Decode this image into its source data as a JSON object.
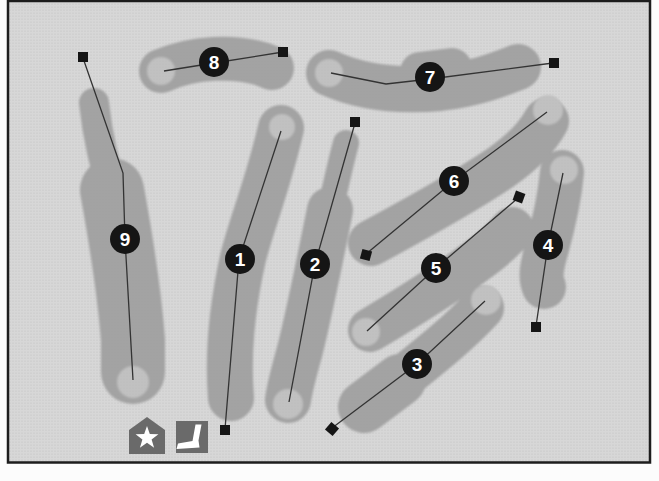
{
  "figure": {
    "colors": {
      "page": "#fcfcfc",
      "map_background": "#d7d7d7",
      "fairway": "#a3a3a3",
      "green": "#c1c1c1",
      "marker": "#151515",
      "line": "#333333",
      "number_text": "#ffffff",
      "icon_background": "#6a6a6a",
      "icon_foreground": "#ffffff",
      "border": "#1d1d1d"
    }
  },
  "holes": [
    {
      "number": "1",
      "badge": [
        240,
        259
      ],
      "green": [
        282,
        127,
        13
      ],
      "tee": [
        225,
        430,
        0
      ],
      "line": [
        [
          225,
          429
        ],
        [
          239,
          259
        ],
        [
          281,
          131
        ]
      ],
      "fairway": [
        {
          "d": "M 281,128 C 268,185 251,225 243,258 C 233,303 227,350 231,398",
          "w": 46
        }
      ]
    },
    {
      "number": "2",
      "badge": [
        315,
        264
      ],
      "green": [
        288,
        404,
        15
      ],
      "tee": [
        355,
        122,
        0
      ],
      "line": [
        [
          355,
          123
        ],
        [
          315,
          264
        ],
        [
          289,
          402
        ]
      ],
      "fairway": [
        {
          "d": "M 346,143 C 340,165 336,185 330,210",
          "w": 26
        },
        {
          "d": "M 330,210 C 320,260 310,310 300,350 C 293,375 289,392 288,400",
          "w": 46
        }
      ]
    },
    {
      "number": "3",
      "badge": [
        417,
        364
      ],
      "green": [
        486,
        300,
        15
      ],
      "tee": [
        332,
        429,
        40
      ],
      "line": [
        [
          332,
          428
        ],
        [
          417,
          364
        ],
        [
          485,
          301
        ]
      ],
      "fairway": [
        {
          "d": "M 364,407 L 400,380",
          "w": 52
        },
        {
          "d": "M 400,380 C 435,352 462,330 482,308",
          "w": 44
        }
      ]
    },
    {
      "number": "4",
      "badge": [
        548,
        245
      ],
      "green": [
        564,
        170,
        14
      ],
      "tee": [
        536,
        327,
        0
      ],
      "line": [
        [
          536,
          326
        ],
        [
          548,
          245
        ],
        [
          563,
          173
        ]
      ],
      "fairway": [
        {
          "d": "M 562,172 C 559,205 552,230 547,248 C 541,268 540,278 544,287",
          "w": 44
        }
      ]
    },
    {
      "number": "5",
      "badge": [
        436,
        268
      ],
      "green": [
        366,
        332,
        14
      ],
      "tee": [
        519,
        197,
        20
      ],
      "line": [
        [
          518,
          198
        ],
        [
          436,
          268
        ],
        [
          367,
          331
        ]
      ],
      "fairway": [
        {
          "d": "M 370,330 C 400,312 440,288 475,262 C 492,250 505,238 512,229",
          "w": 44
        }
      ]
    },
    {
      "number": "6",
      "badge": [
        454,
        181
      ],
      "green": [
        548,
        110,
        15
      ],
      "tee": [
        366,
        255,
        15
      ],
      "line": [
        [
          366,
          254
        ],
        [
          454,
          181
        ],
        [
          547,
          112
        ]
      ],
      "fairway": [
        {
          "d": "M 371,243 C 410,222 460,195 500,168 C 523,152 538,136 546,121",
          "w": 46
        }
      ]
    },
    {
      "number": "7",
      "badge": [
        430,
        77
      ],
      "green": [
        329,
        73,
        14
      ],
      "tee": [
        554,
        63,
        0
      ],
      "line": [
        [
          553,
          63
        ],
        [
          430,
          79
        ],
        [
          386,
          84
        ],
        [
          331,
          73
        ]
      ],
      "fairway": [
        {
          "d": "M 329,73 C 360,87 395,92 440,88 C 475,84 500,74 518,67",
          "w": 46
        },
        {
          "d": "M 420,72 L 452,68",
          "w": 40
        }
      ]
    },
    {
      "number": "8",
      "badge": [
        214,
        62
      ],
      "green": [
        161,
        71,
        14
      ],
      "tee": [
        283,
        52,
        0
      ],
      "line": [
        [
          283,
          52
        ],
        [
          214,
          63
        ],
        [
          164,
          71
        ]
      ],
      "fairway": [
        {
          "d": "M 161,71 C 195,56 235,56 262,64 L 272,68",
          "w": 44
        }
      ]
    },
    {
      "number": "9",
      "badge": [
        125,
        239
      ],
      "green": [
        133,
        382,
        16
      ],
      "tee": [
        83,
        57,
        0
      ],
      "line": [
        [
          83,
          58
        ],
        [
          123,
          173
        ],
        [
          125,
          239
        ],
        [
          133,
          380
        ]
      ],
      "fairway": [
        {
          "d": "M 94,103 C 98,140 105,165 112,190",
          "w": 30
        },
        {
          "d": "M 112,190 C 122,245 130,300 133,340 L 133,372",
          "w": 64
        }
      ]
    }
  ],
  "legend": {
    "clubhouse_icon": "star-pentagon-icon",
    "practice_green_icon": "putter-icon"
  }
}
